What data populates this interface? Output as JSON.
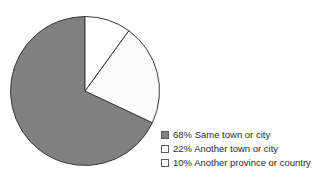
{
  "chart_data": {
    "type": "pie",
    "title": "",
    "subtitle": "",
    "xlabel": "",
    "ylabel": "",
    "legend_position": "right-bottom",
    "grid": false,
    "start_angle_deg": 0,
    "direction": "clockwise",
    "categories": [
      "Same town or city",
      "Another town or city",
      "Another province or country"
    ],
    "values": [
      68,
      22,
      10
    ],
    "unit": "%",
    "slices": [
      {
        "label": "Same town or city",
        "value": 68,
        "value_text": "68%",
        "legend_text": "68% Same town or city",
        "color": "#808080",
        "stroke": "#3a3a3a",
        "start_deg": 115.2,
        "sweep_deg": 244.8
      },
      {
        "label": "Another town or city",
        "value": 22,
        "value_text": "22%",
        "legend_text": "22% Another town or city",
        "color": "#fbfbfb",
        "stroke": "#3a3a3a",
        "start_deg": 36.0,
        "sweep_deg": 79.2
      },
      {
        "label": "Another province or country",
        "value": 10,
        "value_text": "10%",
        "legend_text": "10% Another province or country",
        "color": "#ffffff",
        "stroke": "#3a3a3a",
        "start_deg": 0.0,
        "sweep_deg": 36.0
      }
    ]
  },
  "legend": {
    "items": [
      {
        "label": "68% Same town or city",
        "swatch_color": "#808080"
      },
      {
        "label": "22% Another town or city",
        "swatch_color": "#ffffff"
      },
      {
        "label": "10% Another province or country",
        "swatch_color": "#ffffff"
      }
    ]
  },
  "canvas": {
    "background": "#ffffff",
    "outline_color": "#3a3a3a"
  }
}
